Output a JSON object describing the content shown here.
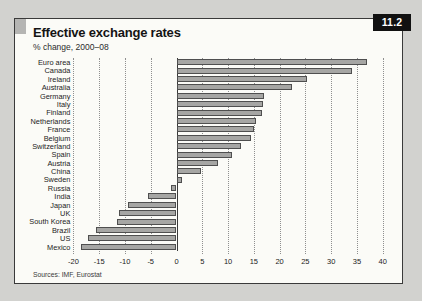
{
  "window": {
    "badge": "11.2"
  },
  "header": {
    "title": "Effective exchange rates",
    "subtitle": "% change, 2000–08"
  },
  "footer": {
    "sources": "Sources: IMF, Eurostat"
  },
  "chart_data": {
    "type": "bar",
    "orientation": "horizontal",
    "title": "Effective exchange rates",
    "subtitle": "% change, 2000–08",
    "categories": [
      "Euro area",
      "Canada",
      "Ireland",
      "Australia",
      "Germany",
      "Italy",
      "Finland",
      "Netherlands",
      "France",
      "Belgium",
      "Switzerland",
      "Spain",
      "Austria",
      "China",
      "Sweden",
      "Russia",
      "India",
      "Japan",
      "UK",
      "South Korea",
      "Brazil",
      "US",
      "Mexico"
    ],
    "values": [
      37,
      34,
      25.4,
      22.4,
      17,
      16.8,
      16.5,
      15.5,
      15,
      14.4,
      12.5,
      10.8,
      8,
      4.8,
      1,
      -1,
      -5.5,
      -9.5,
      -11.2,
      -11.6,
      -15.6,
      -17.2,
      -18.5
    ],
    "xlim": [
      -20,
      40
    ],
    "xticks": [
      -20,
      -15,
      -10,
      -5,
      0,
      5,
      10,
      15,
      20,
      25,
      30,
      35,
      40
    ],
    "grid": "dotted-vertical",
    "legend": "none",
    "bar_color": "#a6a6a4",
    "bar_border": "#4f4f4f",
    "sources": "Sources: IMF, Eurostat"
  }
}
